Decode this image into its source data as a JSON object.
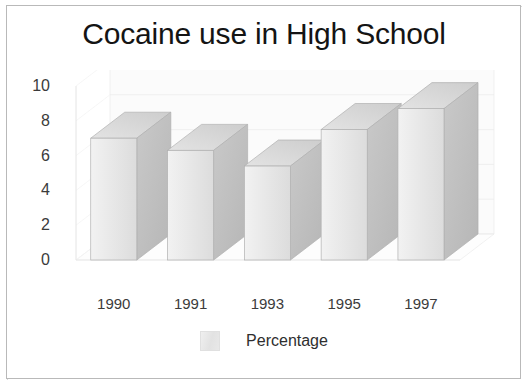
{
  "figure": {
    "title": "Cocaine use in High School",
    "background_color": "#ffffff",
    "frame_color": "#b9b9b9",
    "text_color": "#3b3b3b",
    "title_color": "#141414"
  },
  "legend": {
    "position": "bottom-center",
    "entries": [
      {
        "label": "Percentage",
        "swatch_color": "#e6e6e6"
      }
    ]
  },
  "axes": {
    "y_ticks": [
      "10",
      "8",
      "6",
      "4",
      "2",
      "0"
    ],
    "x_ticks": [
      "1990",
      "1991",
      "1993",
      "1995",
      "1997"
    ]
  },
  "chart_data": {
    "type": "bar",
    "title": "Cocaine use in High School",
    "subtitle": "",
    "xlabel": "",
    "ylabel": "",
    "categories": [
      "1990",
      "1991",
      "1993",
      "1995",
      "1997"
    ],
    "series": [
      {
        "name": "Percentage",
        "values": [
          7.0,
          6.3,
          5.4,
          7.5,
          8.7
        ],
        "color": "#e6e6e6"
      }
    ],
    "values": [
      7.0,
      6.3,
      5.4,
      7.5,
      8.7
    ],
    "ylim": [
      0,
      10
    ],
    "yticks": [
      0,
      2,
      4,
      6,
      8,
      10
    ],
    "grid": true,
    "style": "3d-bar",
    "legend_position": "bottom-center"
  },
  "bar_colors": {
    "front_light": "#f2f2f2",
    "front_dark": "#dcdcdc",
    "top_light": "#e3e3e3",
    "top_dark": "#cdcdcd",
    "side_light": "#c9c9c9",
    "side_dark": "#b6b6b6",
    "edge": "#b0b0b0",
    "gridline": "#ededed",
    "wall": "#fbfbfb"
  }
}
